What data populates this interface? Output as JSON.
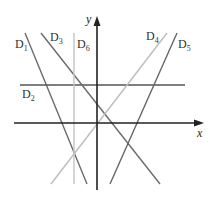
{
  "diagram": {
    "axes": {
      "x_label": "x",
      "y_label": "y",
      "origin": [
        97,
        123
      ],
      "color": "#222222"
    },
    "lines": [
      {
        "id": "D1",
        "label": "D",
        "sub": "1",
        "x1": 25,
        "y1": 33,
        "x2": 87,
        "y2": 184,
        "color": "#6b6b6b",
        "label_x": 15,
        "label_y": 48
      },
      {
        "id": "D2",
        "label": "D",
        "sub": "2",
        "x1": 20,
        "y1": 85,
        "x2": 185,
        "y2": 85,
        "color": "#555555",
        "label_x": 22,
        "label_y": 98
      },
      {
        "id": "D3",
        "label": "D",
        "sub": "3",
        "x1": 41,
        "y1": 33,
        "x2": 160,
        "y2": 184,
        "color": "#6b6b6b",
        "label_x": 50,
        "label_y": 41
      },
      {
        "id": "D4",
        "label": "D",
        "sub": "4",
        "x1": 167,
        "y1": 33,
        "x2": 51,
        "y2": 184,
        "color": "#bdbdbd",
        "label_x": 146,
        "label_y": 40
      },
      {
        "id": "D5",
        "label": "D",
        "sub": "5",
        "x1": 177,
        "y1": 33,
        "x2": 110,
        "y2": 184,
        "color": "#666666",
        "label_x": 178,
        "label_y": 48
      },
      {
        "id": "D6",
        "label": "D",
        "sub": "6",
        "x1": 74,
        "y1": 33,
        "x2": 74,
        "y2": 184,
        "color": "#c4c4c4",
        "label_x": 77,
        "label_y": 48
      }
    ]
  }
}
